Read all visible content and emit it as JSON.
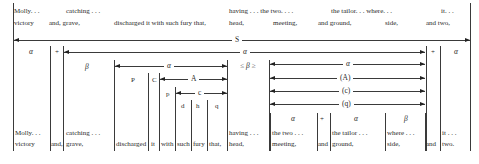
{
  "top_text": {
    "line1": [
      {
        "x": 14,
        "text": "Molly. . ."
      },
      {
        "x": 66,
        "text": "catching . . ."
      },
      {
        "x": 229,
        "text": "having . . . the two. . . ."
      },
      {
        "x": 331,
        "text": "the tailor. . . where. . ."
      },
      {
        "x": 441,
        "text": "it. . ."
      }
    ],
    "line2": [
      {
        "x": 14,
        "text": "victory"
      },
      {
        "x": 49,
        "text": "and, grave,"
      },
      {
        "x": 114,
        "text": "discharged  it  with  such  fury  that,"
      },
      {
        "x": 229,
        "text": "head,"
      },
      {
        "x": 273,
        "text": "meeting,"
      },
      {
        "x": 318,
        "text": "and ground,"
      },
      {
        "x": 385,
        "text": "side,"
      },
      {
        "x": 426,
        "text": "and two,"
      }
    ]
  },
  "arrows": {
    "S": {
      "label": "S",
      "x1": 14,
      "x2": 470,
      "y": 40
    },
    "alpha_main": {
      "label": "α",
      "x1": 64,
      "x2": 425,
      "y": 52
    },
    "alpha_inner": {
      "label": "α",
      "x1": 115,
      "x2": 227,
      "y": 66
    },
    "A": {
      "label": "A",
      "x1": 160,
      "x2": 227,
      "y": 79
    },
    "c": {
      "label": "c",
      "x1": 176,
      "x2": 227,
      "y": 93
    },
    "alpha_right": {
      "label": "α",
      "x1": 270,
      "x2": 425,
      "y": 64
    },
    "A_paren": {
      "label": "(A)",
      "x1": 270,
      "x2": 425,
      "y": 78
    },
    "c_paren": {
      "label": "(c)",
      "x1": 270,
      "x2": 425,
      "y": 91
    },
    "q_paren": {
      "label": "(q)",
      "x1": 270,
      "x2": 425,
      "y": 104
    }
  },
  "labels": {
    "alpha_left": "α",
    "plus_left": "+",
    "plus_right": "+",
    "alpha_far_right": "α",
    "beta": "β",
    "P": "P",
    "C": "C",
    "p": "p",
    "d": "d",
    "h": "h",
    "q": "q",
    "beta_angle": "≤ β ≥"
  },
  "bottom_labels": {
    "alpha1": "α",
    "plus": "+",
    "alpha2": "α",
    "beta": "β"
  },
  "bottom_text": {
    "line1": [
      {
        "x": 15,
        "text": "Molly. . ."
      },
      {
        "x": 66,
        "text": "catching . . ."
      },
      {
        "x": 229,
        "text": "having . . ."
      },
      {
        "x": 272,
        "text": "the two . . ."
      },
      {
        "x": 332,
        "text": "the tailor . . ."
      },
      {
        "x": 387,
        "text": "where . . ."
      },
      {
        "x": 442,
        "text": "it . . ."
      }
    ],
    "line2": [
      {
        "x": 15,
        "text": "victory"
      },
      {
        "x": 51,
        "text": "and,"
      },
      {
        "x": 66,
        "text": "grave,"
      },
      {
        "x": 116,
        "text": "discharged"
      },
      {
        "x": 151,
        "text": "it"
      },
      {
        "x": 161,
        "text": "with"
      },
      {
        "x": 177,
        "text": "such"
      },
      {
        "x": 193,
        "text": "fury"
      },
      {
        "x": 209,
        "text": "that,"
      },
      {
        "x": 229,
        "text": "head,"
      },
      {
        "x": 272,
        "text": "meeting,"
      },
      {
        "x": 318,
        "text": "and"
      },
      {
        "x": 332,
        "text": "ground,"
      },
      {
        "x": 387,
        "text": "side,"
      },
      {
        "x": 426,
        "text": "and"
      },
      {
        "x": 442,
        "text": "two."
      }
    ]
  }
}
